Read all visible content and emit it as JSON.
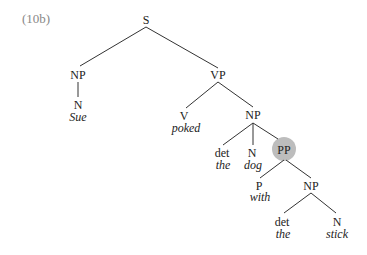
{
  "example_label": "(10b)",
  "highlight_color": "#bdbdbd",
  "nodes": {
    "s": "S",
    "np1": "NP",
    "n1": "N",
    "w_sue": "Sue",
    "vp": "VP",
    "v": "V",
    "w_poked": "poked",
    "np2": "NP",
    "det1": "det",
    "w_the1": "the",
    "n2": "N",
    "w_dog": "dog",
    "pp": "PP",
    "p": "P",
    "w_with": "with",
    "np3": "NP",
    "det2": "det",
    "w_the2": "the",
    "n3": "N",
    "w_stick": "stick"
  }
}
